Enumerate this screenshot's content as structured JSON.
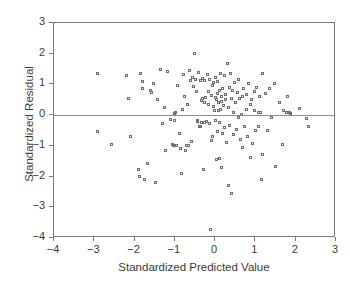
{
  "chart_data": {
    "type": "scatter",
    "title": "",
    "xlabel": "Standardized Predicted Value",
    "ylabel": "Standardized Residual",
    "xlim": [
      -4,
      3
    ],
    "ylim": [
      -4,
      3
    ],
    "xticks": [
      "-4",
      "-3",
      "-2",
      "-1",
      "0",
      "1",
      "2",
      "3"
    ],
    "xtick_values": [
      -4,
      -3,
      -2,
      -1,
      0,
      1,
      2,
      3
    ],
    "yticks": [
      "3",
      "2",
      "1",
      "0",
      "-1",
      "-2",
      "-3",
      "-4"
    ],
    "ytick_values": [
      3,
      2,
      1,
      0,
      -1,
      -2,
      -3,
      -4
    ],
    "grid": false,
    "legend": null,
    "reference_lines": [
      {
        "axis": "y",
        "value": 0,
        "color": "#8e8e8e"
      }
    ],
    "marker": {
      "shape": "open-square",
      "size": 3,
      "color": "#6e6e6e"
    },
    "points": [
      [
        -2.92,
        1.35
      ],
      [
        -2.9,
        -0.55
      ],
      [
        -2.57,
        -0.97
      ],
      [
        -2.18,
        1.28
      ],
      [
        -2.15,
        0.52
      ],
      [
        -2.1,
        -0.7
      ],
      [
        -1.9,
        -1.77
      ],
      [
        -1.86,
        -2.02
      ],
      [
        -1.83,
        1.35
      ],
      [
        -1.8,
        0.86
      ],
      [
        -1.78,
        1.07
      ],
      [
        -1.75,
        -2.1
      ],
      [
        -1.66,
        -1.6
      ],
      [
        -1.6,
        0.78
      ],
      [
        -1.57,
        0.72
      ],
      [
        -1.52,
        1.0
      ],
      [
        -1.47,
        -2.2
      ],
      [
        -1.42,
        0.49
      ],
      [
        -1.34,
        1.48
      ],
      [
        -1.3,
        -0.28
      ],
      [
        -1.25,
        0.24
      ],
      [
        -1.22,
        -1.17
      ],
      [
        -1.18,
        1.4
      ],
      [
        -1.1,
        -0.16
      ],
      [
        -1.05,
        -0.97
      ],
      [
        -1.02,
        -1.01
      ],
      [
        -1.0,
        -0.2
      ],
      [
        -0.99,
        0.05
      ],
      [
        -0.97,
        0.06
      ],
      [
        -0.95,
        -1.0
      ],
      [
        -0.92,
        0.95
      ],
      [
        -0.88,
        -0.62
      ],
      [
        -0.85,
        -1.1
      ],
      [
        -0.82,
        -1.9
      ],
      [
        -0.8,
        0.18
      ],
      [
        -0.78,
        1.32
      ],
      [
        -0.75,
        0.6
      ],
      [
        -0.72,
        -1.18
      ],
      [
        -0.7,
        -1.02
      ],
      [
        -0.68,
        0.33
      ],
      [
        -0.65,
        -1.0
      ],
      [
        -0.62,
        1.45
      ],
      [
        -0.6,
        1.1
      ],
      [
        -0.58,
        -0.88
      ],
      [
        -0.55,
        1.22
      ],
      [
        -0.52,
        0.92
      ],
      [
        -0.5,
        2.0
      ],
      [
        -0.48,
        1.15
      ],
      [
        -0.45,
        0.75
      ],
      [
        -0.43,
        -0.18
      ],
      [
        -0.42,
        -0.22
      ],
      [
        -0.4,
        1.38
      ],
      [
        -0.38,
        -0.4
      ],
      [
        -0.36,
        -0.37
      ],
      [
        -0.35,
        1.12
      ],
      [
        -0.33,
        0.45
      ],
      [
        -0.32,
        -0.24
      ],
      [
        -0.3,
        1.18
      ],
      [
        -0.29,
        0.52
      ],
      [
        -0.28,
        -1.8
      ],
      [
        -0.26,
        0.4
      ],
      [
        -0.25,
        -0.26
      ],
      [
        -0.24,
        1.1
      ],
      [
        -0.22,
        0.56
      ],
      [
        -0.2,
        -0.23
      ],
      [
        -0.18,
        1.3
      ],
      [
        -0.16,
        0.33
      ],
      [
        -0.15,
        0.76
      ],
      [
        -0.14,
        -0.3
      ],
      [
        -0.12,
        1.15
      ],
      [
        -0.1,
        -3.75
      ],
      [
        -0.09,
        0.62
      ],
      [
        -0.08,
        -0.84
      ],
      [
        -0.06,
        0.95
      ],
      [
        -0.05,
        -0.7
      ],
      [
        -0.03,
        0.28
      ],
      [
        -0.02,
        1.05
      ],
      [
        0.0,
        0.15
      ],
      [
        0.01,
        0.55
      ],
      [
        0.02,
        -0.2
      ],
      [
        0.03,
        1.22
      ],
      [
        0.04,
        0.48
      ],
      [
        0.05,
        -1.45
      ],
      [
        0.06,
        0.7
      ],
      [
        0.07,
        -0.55
      ],
      [
        0.08,
        1.08
      ],
      [
        0.09,
        0.12
      ],
      [
        0.1,
        0.38
      ],
      [
        0.11,
        -1.43
      ],
      [
        0.12,
        0.8
      ],
      [
        0.13,
        -0.25
      ],
      [
        0.14,
        1.35
      ],
      [
        0.15,
        0.16
      ],
      [
        0.16,
        0.58
      ],
      [
        0.17,
        -1.72
      ],
      [
        0.18,
        0.44
      ],
      [
        0.19,
        -0.6
      ],
      [
        0.2,
        0.86
      ],
      [
        0.22,
        0.3
      ],
      [
        0.24,
        1.28
      ],
      [
        0.25,
        -0.42
      ],
      [
        0.26,
        0.5
      ],
      [
        0.28,
        0.66
      ],
      [
        0.3,
        -0.9
      ],
      [
        0.32,
        1.68
      ],
      [
        0.34,
        0.22
      ],
      [
        0.35,
        -2.3
      ],
      [
        0.36,
        0.9
      ],
      [
        0.38,
        -0.35
      ],
      [
        0.4,
        1.35
      ],
      [
        0.41,
        0.54
      ],
      [
        0.42,
        -2.57
      ],
      [
        0.44,
        0.78
      ],
      [
        0.46,
        0.08
      ],
      [
        0.48,
        -0.66
      ],
      [
        0.5,
        1.05
      ],
      [
        0.52,
        0.4
      ],
      [
        0.54,
        -0.48
      ],
      [
        0.56,
        0.72
      ],
      [
        0.58,
        -0.1
      ],
      [
        0.6,
        1.15
      ],
      [
        0.62,
        0.52
      ],
      [
        0.64,
        -0.8
      ],
      [
        0.66,
        0.02
      ],
      [
        0.68,
        0.6
      ],
      [
        0.7,
        -1.06
      ],
      [
        0.72,
        0.84
      ],
      [
        0.75,
        -0.38
      ],
      [
        0.78,
        0.18
      ],
      [
        0.8,
        0.66
      ],
      [
        0.82,
        -0.72
      ],
      [
        0.85,
        1.0
      ],
      [
        0.88,
        0.32
      ],
      [
        0.9,
        -1.4
      ],
      [
        0.92,
        0.5
      ],
      [
        0.95,
        -0.95
      ],
      [
        0.98,
        0.76
      ],
      [
        1.0,
        0.14
      ],
      [
        1.02,
        -0.52
      ],
      [
        1.05,
        0.88
      ],
      [
        1.08,
        0.06
      ],
      [
        1.1,
        -0.4
      ],
      [
        1.12,
        0.58
      ],
      [
        1.14,
        0.08
      ],
      [
        1.16,
        -2.1
      ],
      [
        1.18,
        -1.3
      ],
      [
        1.2,
        1.35
      ],
      [
        1.25,
        0.7
      ],
      [
        1.3,
        -0.52
      ],
      [
        1.35,
        0.86
      ],
      [
        1.42,
        -0.08
      ],
      [
        1.48,
        1.0
      ],
      [
        1.52,
        -1.68
      ],
      [
        1.6,
        0.4
      ],
      [
        1.68,
        -0.98
      ],
      [
        1.72,
        0.12
      ],
      [
        1.78,
        0.08
      ],
      [
        1.8,
        0.58
      ],
      [
        1.85,
        0.06
      ],
      [
        1.88,
        0.04
      ],
      [
        2.1,
        0.2
      ],
      [
        2.28,
        -0.12
      ],
      [
        2.32,
        -0.4
      ]
    ]
  }
}
